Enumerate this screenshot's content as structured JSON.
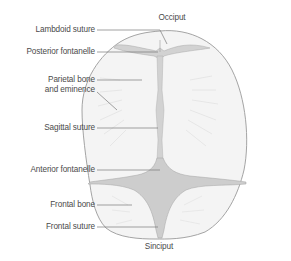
{
  "diagram": {
    "colors": {
      "outline": "#9a9a9a",
      "bone_fill": "#f3f3f3",
      "fontanelle_fill": "#cfcfcf",
      "leader_line": "#7a7a7a",
      "text": "#4a4a4a"
    },
    "labels": {
      "top": "Occiput",
      "bottom": "Sinciput",
      "left": [
        {
          "id": "lambdoid-suture",
          "text": "Lambdoid suture"
        },
        {
          "id": "posterior-fontanelle",
          "text": "Posterior fontanelle"
        },
        {
          "id": "parietal-bone",
          "line1": "Parietal bone",
          "line2": "and eminence"
        },
        {
          "id": "sagittal-suture",
          "text": "Sagittal suture"
        },
        {
          "id": "anterior-fontanelle",
          "text": "Anterior fontanelle"
        },
        {
          "id": "frontal-bone",
          "text": "Frontal bone"
        },
        {
          "id": "frontal-suture",
          "text": "Frontal suture"
        }
      ]
    }
  }
}
